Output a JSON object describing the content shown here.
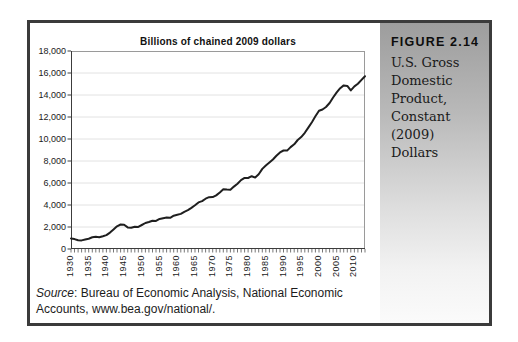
{
  "figure": {
    "label": "FIGURE 2.14",
    "caption": "U.S. Gross Domestic Product, Constant (2009) Dollars",
    "caption_lines": [
      "U.S. Gross",
      "Domestic",
      "Product,",
      "Constant (2009)",
      "Dollars"
    ]
  },
  "source_note": {
    "label": "Source",
    "line1_rest": ": Bureau of Economic Analysis, National Economic",
    "line2": "Accounts, www.bea.gov/national/."
  },
  "colors": {
    "frame_border": "#3b3b3b",
    "page_bg": "#ffffff",
    "sidebar_gradient_top": "#9d9d9d",
    "sidebar_gradient_bottom": "#fbfbfb",
    "line": "#1f1f1f",
    "grid": "#e2e2e2",
    "plot_border": "#9a9a9a",
    "axis": "#3c3c3c"
  },
  "chart_data": {
    "type": "line",
    "title": "Billions of chained 2009 dollars",
    "xlabel": "",
    "ylabel": "",
    "xlim": [
      1930,
      2013
    ],
    "ylim": [
      0,
      18000
    ],
    "grid": "horizontal",
    "legend": "none",
    "line_color": "#1f1f1f",
    "grid_color": "#e2e2e2",
    "y_ticks": [
      {
        "value": 0,
        "label": "0"
      },
      {
        "value": 2000,
        "label": "2,000"
      },
      {
        "value": 4000,
        "label": "4,000"
      },
      {
        "value": 6000,
        "label": "6,000"
      },
      {
        "value": 8000,
        "label": "8,000"
      },
      {
        "value": 10000,
        "label": "10,000"
      },
      {
        "value": 12000,
        "label": "12,000"
      },
      {
        "value": 14000,
        "label": "14,000"
      },
      {
        "value": 16000,
        "label": "16,000"
      },
      {
        "value": 18000,
        "label": "18,000"
      }
    ],
    "x_tick_years": [
      1930,
      1935,
      1940,
      1945,
      1950,
      1955,
      1960,
      1965,
      1970,
      1975,
      1980,
      1985,
      1990,
      1995,
      2000,
      2005,
      2010
    ],
    "series": [
      {
        "x": [
          1930,
          1931,
          1932,
          1933,
          1934,
          1935,
          1936,
          1937,
          1938,
          1939,
          1940,
          1941,
          1942,
          1943,
          1944,
          1945,
          1946,
          1947,
          1948,
          1949,
          1950,
          1951,
          1952,
          1953,
          1954,
          1955,
          1956,
          1957,
          1958,
          1959,
          1960,
          1961,
          1962,
          1963,
          1964,
          1965,
          1966,
          1967,
          1968,
          1969,
          1970,
          1971,
          1972,
          1973,
          1974,
          1975,
          1976,
          1977,
          1978,
          1979,
          1980,
          1981,
          1982,
          1983,
          1984,
          1985,
          1986,
          1987,
          1988,
          1989,
          1990,
          1991,
          1992,
          1993,
          1994,
          1995,
          1996,
          1997,
          1998,
          1999,
          2000,
          2001,
          2002,
          2003,
          2004,
          2005,
          2006,
          2007,
          2008,
          2009,
          2010,
          2011,
          2012,
          2013
        ],
        "values": [
          966,
          904,
          788,
          778,
          862,
          939,
          1061,
          1115,
          1077,
          1163,
          1266,
          1490,
          1772,
          2064,
          2231,
          2212,
          1960,
          1939,
          2020,
          2009,
          2184,
          2360,
          2457,
          2571,
          2556,
          2740,
          2797,
          2856,
          2835,
          3031,
          3108,
          3188,
          3383,
          3530,
          3734,
          3977,
          4239,
          4355,
          4569,
          4713,
          4722,
          4877,
          5134,
          5424,
          5396,
          5385,
          5675,
          5937,
          6267,
          6466,
          6450,
          6618,
          6491,
          6792,
          7285,
          7594,
          7861,
          8133,
          8475,
          8786,
          8955,
          8948,
          9267,
          9521,
          9905,
          10175,
          10561,
          11035,
          11526,
          12066,
          12560,
          12682,
          12909,
          13271,
          13774,
          14234,
          14614,
          14874,
          14830,
          14419,
          14784,
          15021,
          15369,
          15710
        ]
      }
    ]
  }
}
